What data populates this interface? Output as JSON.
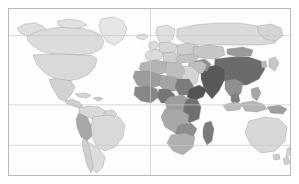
{
  "figure": {
    "kind": "world-choropleth-map",
    "projection": "equirectangular",
    "frame_color": "#b9b9b9",
    "ocean_color": "#fdfdfd",
    "country_border_color": "#8e8e8e",
    "graticule_color": "#c8c8c8",
    "has_title": false,
    "has_legend": false,
    "has_axis_labels": false,
    "has_colorbar": false
  },
  "chart_data": {
    "type": "heatmap",
    "title": "",
    "subtitle": "",
    "xlabel": "",
    "ylabel": "",
    "legend_position": "none",
    "grid": true,
    "scale_kind": "sequential-grayscale",
    "shade_levels": [
      {
        "name": "no-data",
        "hex": "#ffffff"
      },
      {
        "name": "very-light",
        "hex": "#e3e3e3"
      },
      {
        "name": "light",
        "hex": "#d2d2d2"
      },
      {
        "name": "medium-light",
        "hex": "#bdbdbd"
      },
      {
        "name": "medium",
        "hex": "#a3a3a3"
      },
      {
        "name": "medium-dark",
        "hex": "#8a8a8a"
      },
      {
        "name": "dark",
        "hex": "#6e6e6e"
      },
      {
        "name": "very-dark",
        "hex": "#4f4f4f"
      }
    ],
    "graticule": {
      "meridians_x": [
        150.5
      ],
      "parallels_y": [
        35.0,
        105.0,
        146.0
      ]
    },
    "regions": [
      {
        "name": "Greenland",
        "shade": "#e6e6e6"
      },
      {
        "name": "Alaska",
        "shade": "#dedede"
      },
      {
        "name": "Canada",
        "shade": "#dcdcdc"
      },
      {
        "name": "United States",
        "shade": "#d9d9d9"
      },
      {
        "name": "Mexico",
        "shade": "#d2d2d2"
      },
      {
        "name": "Central America",
        "shade": "#cfcfcf"
      },
      {
        "name": "Caribbean",
        "shade": "#d4d4d4"
      },
      {
        "name": "Colombia/Venezuela",
        "shade": "#d9d9d9"
      },
      {
        "name": "Brazil",
        "shade": "#d9d9d9"
      },
      {
        "name": "Peru/Bolivia",
        "shade": "#a8a8a8"
      },
      {
        "name": "Chile/Argentina",
        "shade": "#dcdcdc"
      },
      {
        "name": "Western Europe",
        "shade": "#dddddd"
      },
      {
        "name": "Eastern Europe",
        "shade": "#cfcfcf"
      },
      {
        "name": "Scandinavia",
        "shade": "#e0e0e0"
      },
      {
        "name": "Russia",
        "shade": "#dadada"
      },
      {
        "name": "Kazakhstan/Central Asia",
        "shade": "#c6c6c6"
      },
      {
        "name": "Mongolia",
        "shade": "#9a9a9a"
      },
      {
        "name": "China",
        "shade": "#6b6b6b"
      },
      {
        "name": "India",
        "shade": "#585858"
      },
      {
        "name": "Southeast Asia",
        "shade": "#8f8f8f"
      },
      {
        "name": "Indonesia",
        "shade": "#b5b5b5"
      },
      {
        "name": "Japan/Korea",
        "shade": "#c8c8c8"
      },
      {
        "name": "Australia",
        "shade": "#d8d8d8"
      },
      {
        "name": "New Zealand",
        "shade": "#d8d8d8"
      },
      {
        "name": "North Africa",
        "shade": "#b4b4b4"
      },
      {
        "name": "Sahel",
        "shade": "#9c9c9c"
      },
      {
        "name": "West Africa",
        "shade": "#878787"
      },
      {
        "name": "Central Africa",
        "shade": "#9e9e9e"
      },
      {
        "name": "Horn of Africa",
        "shade": "#545454"
      },
      {
        "name": "East Africa",
        "shade": "#707070"
      },
      {
        "name": "Southern Africa",
        "shade": "#b0b0b0"
      },
      {
        "name": "Madagascar",
        "shade": "#7a7a7a"
      },
      {
        "name": "Middle East",
        "shade": "#bfbfbf"
      },
      {
        "name": "Arabian Peninsula",
        "shade": "#d5d5d5"
      }
    ]
  }
}
